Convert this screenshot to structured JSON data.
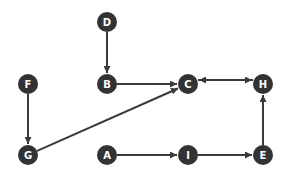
{
  "diagram": {
    "type": "directed-graph",
    "node_color": "#333333",
    "edge_color": "#3a3a3a",
    "label_color": "#ffffff",
    "nodes": [
      {
        "id": "D",
        "label": "D",
        "x": 107,
        "y": 22
      },
      {
        "id": "B",
        "label": "B",
        "x": 107,
        "y": 84
      },
      {
        "id": "C",
        "label": "C",
        "x": 188,
        "y": 84
      },
      {
        "id": "H",
        "label": "H",
        "x": 263,
        "y": 84
      },
      {
        "id": "F",
        "label": "F",
        "x": 28,
        "y": 84
      },
      {
        "id": "G",
        "label": "G",
        "x": 28,
        "y": 155
      },
      {
        "id": "A",
        "label": "A",
        "x": 107,
        "y": 155
      },
      {
        "id": "I",
        "label": "I",
        "x": 188,
        "y": 155
      },
      {
        "id": "E",
        "label": "E",
        "x": 263,
        "y": 155
      }
    ],
    "edges": [
      {
        "from": "D",
        "to": "B"
      },
      {
        "from": "B",
        "to": "C"
      },
      {
        "from": "C",
        "to": "H",
        "offset": -4
      },
      {
        "from": "H",
        "to": "C",
        "offset": 4
      },
      {
        "from": "F",
        "to": "G"
      },
      {
        "from": "G",
        "to": "C"
      },
      {
        "from": "A",
        "to": "I"
      },
      {
        "from": "I",
        "to": "E"
      },
      {
        "from": "E",
        "to": "H"
      }
    ]
  }
}
